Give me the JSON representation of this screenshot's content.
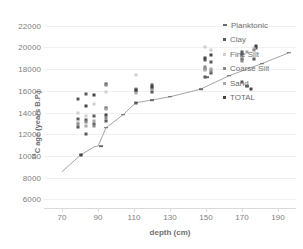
{
  "chart_data": {
    "type": "scatter",
    "title": "",
    "xlabel": "depth (cm)",
    "ylabel": "14C age (years B.P.)",
    "ylabel_prefix": "14",
    "ylabel_rest": "C age (years B.P.)",
    "xlim": [
      60,
      200
    ],
    "ylim": [
      22800,
      5200
    ],
    "y_inverted": true,
    "grid": true,
    "legend_position": "top-right",
    "xticks": [
      70,
      90,
      110,
      130,
      150,
      170,
      190
    ],
    "xtick_labels": [
      "70",
      "90",
      "110",
      "130",
      "150",
      "170",
      "190"
    ],
    "yticks": [
      6000,
      8000,
      10000,
      12000,
      14000,
      16000,
      18000,
      20000,
      22000
    ],
    "ytick_labels": [
      "6000",
      "8000",
      "10000",
      "12000",
      "14000",
      "16000",
      "18000",
      "20000",
      "22000"
    ],
    "series": [
      {
        "name": "Planktonic",
        "marker": "line-dash",
        "color": "#6b6b6b",
        "points": [
          {
            "x": 80.5,
            "y": 10100
          },
          {
            "x": 91.5,
            "y": 10900
          },
          {
            "x": 94.5,
            "y": 12600
          },
          {
            "x": 104.0,
            "y": 13800
          },
          {
            "x": 111.0,
            "y": 14900
          },
          {
            "x": 120.0,
            "y": 15150
          },
          {
            "x": 130.0,
            "y": 15450
          },
          {
            "x": 147.0,
            "y": 16150
          },
          {
            "x": 150.5,
            "y": 17250
          },
          {
            "x": 163.0,
            "y": 17400
          },
          {
            "x": 173.0,
            "y": 16400
          },
          {
            "x": 181.0,
            "y": 18500
          },
          {
            "x": 196.0,
            "y": 19500
          }
        ]
      },
      {
        "name": "Clay",
        "marker": "square",
        "color": "#595959",
        "points": [
          {
            "x": 79.0,
            "y": 12700
          },
          {
            "x": 79.0,
            "y": 13400
          },
          {
            "x": 79.0,
            "y": 15200
          },
          {
            "x": 83.5,
            "y": 12050
          },
          {
            "x": 83.5,
            "y": 13300
          },
          {
            "x": 83.5,
            "y": 15700
          },
          {
            "x": 87.5,
            "y": 12900
          },
          {
            "x": 87.5,
            "y": 13700
          },
          {
            "x": 94.5,
            "y": 13200
          },
          {
            "x": 94.5,
            "y": 14400
          },
          {
            "x": 94.5,
            "y": 16600
          },
          {
            "x": 111.0,
            "y": 14900
          },
          {
            "x": 111.0,
            "y": 16000
          },
          {
            "x": 120.0,
            "y": 15900
          },
          {
            "x": 120.0,
            "y": 16500
          },
          {
            "x": 149.5,
            "y": 17250
          },
          {
            "x": 149.5,
            "y": 18000
          },
          {
            "x": 149.5,
            "y": 18850
          },
          {
            "x": 152.5,
            "y": 17600
          },
          {
            "x": 152.5,
            "y": 18650
          },
          {
            "x": 170.0,
            "y": 16800
          },
          {
            "x": 170.0,
            "y": 18900
          },
          {
            "x": 170.0,
            "y": 19550
          },
          {
            "x": 173.0,
            "y": 16400
          },
          {
            "x": 176.5,
            "y": 18900
          },
          {
            "x": 178.0,
            "y": 19900
          }
        ]
      },
      {
        "name": "Fine Silt",
        "marker": "square",
        "color": "#cfcfcf",
        "points": [
          {
            "x": 79.0,
            "y": 13150
          },
          {
            "x": 79.0,
            "y": 14000
          },
          {
            "x": 83.5,
            "y": 13650
          },
          {
            "x": 87.5,
            "y": 14800
          },
          {
            "x": 94.5,
            "y": 15900
          },
          {
            "x": 111.0,
            "y": 17500
          },
          {
            "x": 149.5,
            "y": 20000
          },
          {
            "x": 152.5,
            "y": 19750
          },
          {
            "x": 170.0,
            "y": 19400
          },
          {
            "x": 176.5,
            "y": 19900
          }
        ]
      },
      {
        "name": "Coarse Silt",
        "marker": "square",
        "color": "#8a8a8a",
        "points": [
          {
            "x": 79.0,
            "y": 12950
          },
          {
            "x": 83.5,
            "y": 13100
          },
          {
            "x": 87.5,
            "y": 12750
          },
          {
            "x": 94.5,
            "y": 13450
          },
          {
            "x": 94.5,
            "y": 16550
          },
          {
            "x": 111.0,
            "y": 16150
          },
          {
            "x": 120.0,
            "y": 16150
          },
          {
            "x": 149.5,
            "y": 18150
          },
          {
            "x": 152.5,
            "y": 17850
          },
          {
            "x": 170.0,
            "y": 18750
          },
          {
            "x": 176.5,
            "y": 19800
          }
        ]
      },
      {
        "name": "Sand",
        "marker": "square",
        "color": "#a8a8a8",
        "points": [
          {
            "x": 83.5,
            "y": 12800
          },
          {
            "x": 87.5,
            "y": 13250
          },
          {
            "x": 94.5,
            "y": 14300
          },
          {
            "x": 111.0,
            "y": 15800
          },
          {
            "x": 120.0,
            "y": 16300
          },
          {
            "x": 149.5,
            "y": 17900
          },
          {
            "x": 152.5,
            "y": 18050
          },
          {
            "x": 170.0,
            "y": 19100
          },
          {
            "x": 173.0,
            "y": 19600
          }
        ]
      },
      {
        "name": "TOTAL",
        "marker": "square",
        "color": "#444444",
        "points": [
          {
            "x": 80.5,
            "y": 10100
          },
          {
            "x": 83.5,
            "y": 14600
          },
          {
            "x": 87.5,
            "y": 15650
          },
          {
            "x": 94.5,
            "y": 13750
          },
          {
            "x": 111.0,
            "y": 16100
          },
          {
            "x": 120.0,
            "y": 16350
          },
          {
            "x": 149.5,
            "y": 19000
          },
          {
            "x": 152.5,
            "y": 19300
          },
          {
            "x": 170.0,
            "y": 19350
          },
          {
            "x": 175.0,
            "y": 16200
          },
          {
            "x": 178.0,
            "y": 20150
          }
        ]
      }
    ],
    "trend_line": {
      "name": "age-depth model",
      "color": "#9a9a9a",
      "points": [
        {
          "x": 70.0,
          "y": 8550
        },
        {
          "x": 80.5,
          "y": 10100
        },
        {
          "x": 88.0,
          "y": 10850
        },
        {
          "x": 90.0,
          "y": 10900
        },
        {
          "x": 92.0,
          "y": 11650
        },
        {
          "x": 94.5,
          "y": 12600
        },
        {
          "x": 104.0,
          "y": 13800
        },
        {
          "x": 111.0,
          "y": 14900
        },
        {
          "x": 120.0,
          "y": 15150
        },
        {
          "x": 130.0,
          "y": 15450
        },
        {
          "x": 147.0,
          "y": 16150
        },
        {
          "x": 163.0,
          "y": 17400
        },
        {
          "x": 181.0,
          "y": 18500
        },
        {
          "x": 196.0,
          "y": 19500
        }
      ]
    },
    "legend_entries": [
      {
        "label": "Planktonic",
        "color": "#6b6b6b",
        "key": "planktonic"
      },
      {
        "label": "Clay",
        "color": "#595959",
        "key": "clay"
      },
      {
        "label": "Fine Silt",
        "color": "#cfcfcf",
        "key": "finesilt"
      },
      {
        "label": "Coarse Silt",
        "color": "#8a8a8a",
        "key": "coarsesilt"
      },
      {
        "label": "Sand",
        "color": "#a8a8a8",
        "key": "sand"
      },
      {
        "label": "TOTAL",
        "color": "#444444",
        "key": "total"
      }
    ]
  }
}
